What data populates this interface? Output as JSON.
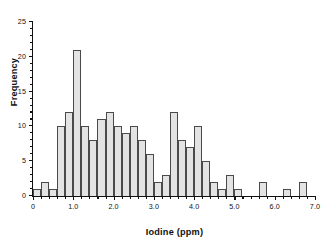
{
  "chart_data": {
    "type": "bar",
    "title": "",
    "subtitle": "",
    "xlabel": "Iodine (ppm)",
    "ylabel": "Frequency",
    "xlim": [
      0,
      7.0
    ],
    "ylim": [
      0,
      25
    ],
    "grid": false,
    "legend": null,
    "bin_width": 0.2,
    "x_tick_labels": [
      "0",
      "1.0",
      "2.0",
      "3.0",
      "4.0",
      "5.0",
      "6.0",
      "7.0"
    ],
    "x_tick_values": [
      0,
      1.0,
      2.0,
      3.0,
      4.0,
      5.0,
      6.0,
      7.0
    ],
    "x_minor_tick_step": 0.2,
    "y_tick_labels": [
      "0",
      "5",
      "10",
      "15",
      "20",
      "25"
    ],
    "y_tick_values": [
      0,
      5,
      10,
      15,
      20,
      25
    ],
    "y_minor_tick_step": 1,
    "bin_starts": [
      0.0,
      0.2,
      0.4,
      0.6,
      0.8,
      1.0,
      1.2,
      1.4,
      1.6,
      1.8,
      2.0,
      2.2,
      2.4,
      2.6,
      2.8,
      3.0,
      3.2,
      3.4,
      3.6,
      3.8,
      4.0,
      4.2,
      4.4,
      4.6,
      4.8,
      5.0,
      5.2,
      5.4,
      5.6,
      5.8,
      6.0,
      6.2,
      6.4,
      6.6,
      6.8
    ],
    "bin_ends": [
      0.2,
      0.4,
      0.6,
      0.8,
      1.0,
      1.2,
      1.4,
      1.6,
      1.8,
      2.0,
      2.2,
      2.4,
      2.6,
      2.8,
      3.0,
      3.2,
      3.4,
      3.6,
      3.8,
      4.0,
      4.2,
      4.4,
      4.6,
      4.8,
      5.0,
      5.2,
      5.4,
      5.6,
      5.8,
      6.0,
      6.2,
      6.4,
      6.6,
      6.8,
      7.0
    ],
    "categories": [
      "0.0-0.2",
      "0.2-0.4",
      "0.4-0.6",
      "0.6-0.8",
      "0.8-1.0",
      "1.0-1.2",
      "1.2-1.4",
      "1.4-1.6",
      "1.6-1.8",
      "1.8-2.0",
      "2.0-2.2",
      "2.2-2.4",
      "2.4-2.6",
      "2.6-2.8",
      "2.8-3.0",
      "3.0-3.2",
      "3.2-3.4",
      "3.4-3.6",
      "3.6-3.8",
      "3.8-4.0",
      "4.0-4.2",
      "4.2-4.4",
      "4.4-4.6",
      "4.6-4.8",
      "4.8-5.0",
      "5.0-5.2",
      "5.2-5.4",
      "5.4-5.6",
      "5.6-5.8",
      "5.8-6.0",
      "6.0-6.2",
      "6.2-6.4",
      "6.4-6.6",
      "6.6-6.8",
      "6.8-7.0"
    ],
    "values": [
      1,
      2,
      1,
      10,
      12,
      21,
      10,
      8,
      11,
      12,
      10,
      9,
      10,
      8,
      6,
      2,
      3,
      12,
      8,
      7,
      10,
      5,
      2,
      1,
      3,
      1,
      0,
      0,
      2,
      0,
      0,
      1,
      0,
      2,
      0
    ],
    "colors": {
      "bar_fill": "#e3e3e3",
      "bar_edge": "#4a4a4a",
      "axis": "#111111",
      "background": "#ffffff"
    }
  }
}
